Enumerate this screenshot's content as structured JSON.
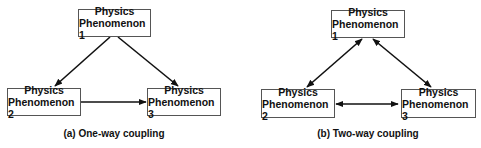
{
  "diagrams": [
    {
      "id": "a",
      "caption": "(a) One-way coupling",
      "nodes": [
        {
          "id": "p1",
          "line1": "Physics",
          "line2": "Phenomenon 1"
        },
        {
          "id": "p2",
          "line1": "Physics",
          "line2": "Phenomenon 2"
        },
        {
          "id": "p3",
          "line1": "Physics",
          "line2": "Phenomenon 3"
        }
      ],
      "edges": [
        {
          "from": "p1",
          "to": "p2",
          "direction": "one-way"
        },
        {
          "from": "p1",
          "to": "p3",
          "direction": "one-way"
        },
        {
          "from": "p2",
          "to": "p3",
          "direction": "one-way"
        }
      ]
    },
    {
      "id": "b",
      "caption": "(b) Two-way coupling",
      "nodes": [
        {
          "id": "p1",
          "line1": "Physics",
          "line2": "Phenomenon 1"
        },
        {
          "id": "p2",
          "line1": "Physics",
          "line2": "Phenomenon 2"
        },
        {
          "id": "p3",
          "line1": "Physics",
          "line2": "Phenomenon 3"
        }
      ],
      "edges": [
        {
          "from": "p1",
          "to": "p2",
          "direction": "two-way"
        },
        {
          "from": "p1",
          "to": "p3",
          "direction": "two-way"
        },
        {
          "from": "p2",
          "to": "p3",
          "direction": "two-way"
        }
      ]
    }
  ],
  "colors": {
    "line": "#111111",
    "box_border": "#555555",
    "background": "#ffffff"
  }
}
